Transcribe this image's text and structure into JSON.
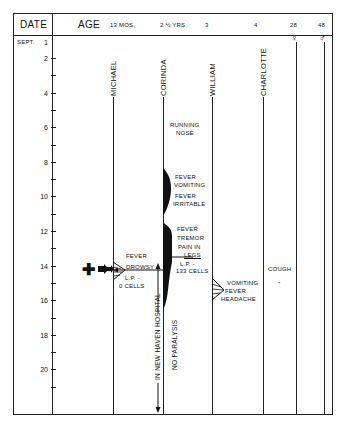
{
  "header": {
    "date_label": "DATE",
    "age_label": "AGE",
    "ages": [
      "13 MOS.",
      "2 ½ YRS.",
      "3",
      "4",
      "28",
      "48"
    ],
    "month_label": "SEPT.",
    "female_symbol": "♀",
    "male_symbol": "♂"
  },
  "day_axis": {
    "labels": [
      "1",
      "2",
      "4",
      "6",
      "8",
      "10",
      "12",
      "14",
      "16",
      "18",
      "20"
    ]
  },
  "patients": [
    {
      "name": "MICHAEL",
      "age": "13 MOS."
    },
    {
      "name": "CORINDA",
      "age": "2 ½ YRS."
    },
    {
      "name": "WILLIAM",
      "age": "3"
    },
    {
      "name": "CHARLOTTE",
      "age": "4"
    }
  ],
  "annotations": {
    "corinda_running_nose": [
      "RUNNING",
      "NOSE"
    ],
    "corinda_fever_vomiting": [
      "FEVER",
      "VOMITING"
    ],
    "corinda_fever_irritable": [
      "FEVER",
      "IRRITABLE"
    ],
    "corinda_fever_tremor": [
      "FEVER",
      "TREMOR",
      "PAIN IN",
      "LEGS"
    ],
    "corinda_lp": [
      "L.P. -",
      "133 CELLS"
    ],
    "michael_fever": [
      "FEVER",
      "DROWSY"
    ],
    "michael_lp": [
      "L.P. -",
      "0 CELLS"
    ],
    "william_symptoms": [
      "VOMITING",
      "FEVER",
      "HEADACHE"
    ],
    "charlotte_cough": "COUGH",
    "charlotte_ditto": "\"",
    "hospital": "IN NEW HAVEN HOSPITAL",
    "no_paralysis": "NO PARALYSIS",
    "death_marker": "✚"
  }
}
